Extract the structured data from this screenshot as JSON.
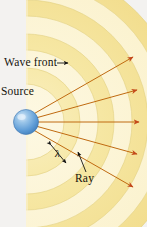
{
  "figure": {
    "background_color": "#f3f2f0",
    "labels": {
      "wave_front": "Wave front",
      "source": "Source",
      "wavelength": "λ",
      "ray": "Ray"
    },
    "colors": {
      "wavefront_band": "#f5e49a",
      "wavefront_band_light": "#fbf3cf",
      "wavefront_edge": "#e8d689",
      "source_sphere": "#5b9bd5",
      "source_highlight": "#cfe4f7",
      "ray": "#c06a10",
      "arrow": "#c4481a",
      "leader_line": "#1a1a1a",
      "text": "#15120d"
    },
    "source": {
      "cx": 26,
      "cy": 122,
      "r": 12,
      "shape": "sphere"
    },
    "wave_fronts": {
      "count": 4,
      "radii": [
        54,
        88,
        122,
        156
      ],
      "band_thickness": 16,
      "angular_span_deg": 180,
      "note": "concentric semicircular arcs centered on the source, right half only"
    },
    "rays": {
      "count": 5,
      "angles_deg": [
        -52,
        -26,
        0,
        26,
        52
      ],
      "arrowhead": true,
      "description": "straight arrows radiating outward from source, perpendicular to wave fronts"
    },
    "annotations": {
      "wave_front_pointer": "arrow pointing right from the Wave front label to an arc",
      "wavelength_marker": "double-headed arrow spanning one wavelength between successive wave fronts",
      "ray_pointer": "leader line from Ray label to one of the rays"
    }
  }
}
